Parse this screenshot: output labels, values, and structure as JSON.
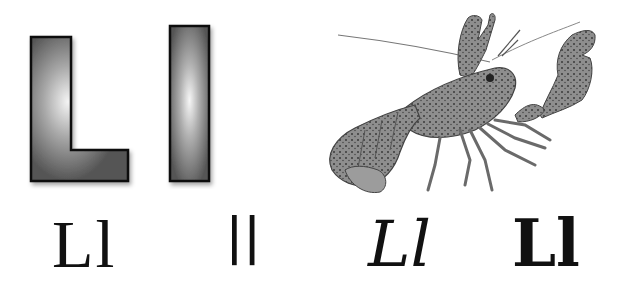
{
  "card": {
    "letter": "L",
    "subject": "lobster",
    "block_letters": {
      "uppercase": "L",
      "lowercase": "l"
    },
    "variants": [
      {
        "style": "serif",
        "text": "Ll"
      },
      {
        "style": "sans-serif",
        "text": "ll"
      },
      {
        "style": "cursive",
        "text": "Ll"
      },
      {
        "style": "slab-serif",
        "text": "Ll"
      }
    ],
    "colors": {
      "background": "#ffffff",
      "block_fill": "#5a5a5a",
      "block_highlight": "#f2f2f2",
      "block_outline": "#111111",
      "ink": "#111111"
    }
  }
}
